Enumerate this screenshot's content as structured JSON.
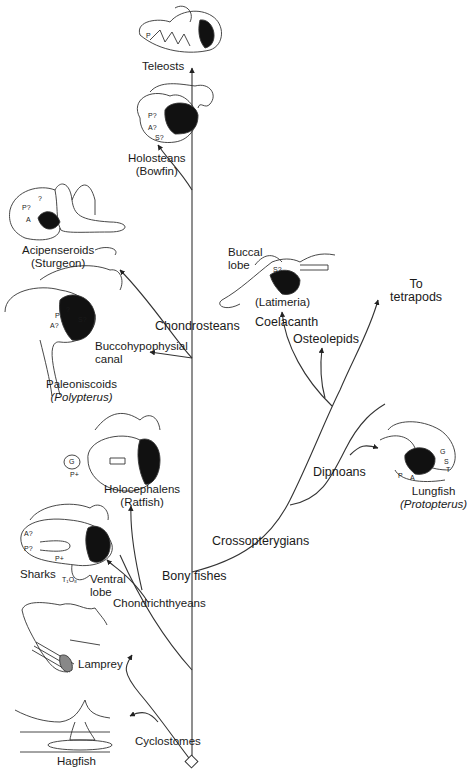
{
  "diagram": {
    "colors": {
      "line": "#333333",
      "fill_dark": "#111111",
      "fill_gray": "#d8d8d8",
      "background": "#ffffff"
    },
    "taxa": {
      "teleosts": {
        "label": "Teleosts",
        "glyphs": [
          "P",
          "M",
          "P+"
        ]
      },
      "holosteans": {
        "label": "Holosteans",
        "common": "(Bowfin)",
        "glyphs": [
          "P?",
          "A?",
          "S?",
          "P+",
          "G?",
          "T",
          "M",
          "P+"
        ]
      },
      "acipenseroids": {
        "label": "Acipenseroids",
        "common": "(Sturgeon)",
        "glyphs": [
          "?",
          "P?",
          "A",
          "?"
        ]
      },
      "paleoniscoids": {
        "label": "Paleoniscoids",
        "genus": "(Polypterus)",
        "glyphs": [
          "P",
          "?",
          "A?",
          "S?",
          "M",
          "P+"
        ]
      },
      "buccohypophysial": {
        "label_line1": "Buccohypophysial",
        "label_line2": "canal"
      },
      "holocephalens": {
        "label": "Holocephalens",
        "common": "(Ratfish)",
        "glyphs": [
          "?",
          "?",
          "?",
          "G",
          "P+"
        ]
      },
      "sharks": {
        "label": "Sharks",
        "glyphs": [
          "A?",
          "?",
          "P?",
          "P+",
          "M",
          "T₁O₈"
        ]
      },
      "ventral_lobe": {
        "label_line1": "Ventral",
        "label_line2": "lobe"
      },
      "lamprey": {
        "label": "Lamprey"
      },
      "hagfish": {
        "label": "Hagfish"
      },
      "latimeria": {
        "buccal_line1": "Buccal",
        "buccal_line2": "lobe",
        "genus": "(Latimeria)",
        "glyphs": [
          "S?",
          "?",
          "?"
        ]
      },
      "lungfish": {
        "label": "Lungfish",
        "genus": "(Protopterus)",
        "glyphs": [
          "M",
          "P+",
          "G",
          "S",
          "T",
          "P",
          "A",
          "G"
        ]
      }
    },
    "clades": {
      "chondrosteans": "Chondrosteans",
      "coelacanth": "Coelacanth",
      "osteolepids": "Osteolepids",
      "to_tetrapods_line1": "To",
      "to_tetrapods_line2": "tetrapods",
      "dipnoans": "Dipnoans",
      "crossopterygians": "Crossopterygians",
      "bony_fishes": "Bony fishes",
      "chondrichthyeans": "Chondrichthyeans",
      "cyclostomes": "Cyclostomes"
    }
  }
}
